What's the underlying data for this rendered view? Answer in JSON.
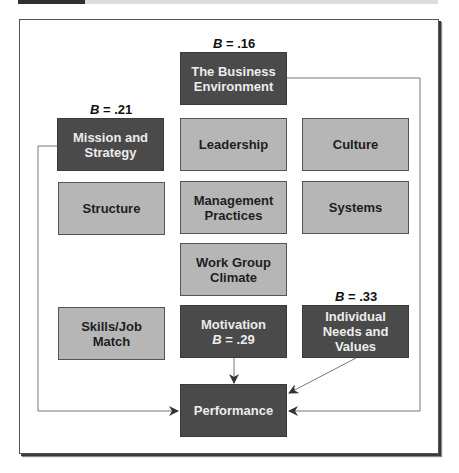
{
  "figure": {
    "title": "",
    "colors": {
      "driver_dark": "#4a4a4a",
      "factor_light": "#b6b6b6",
      "connector": "#666666"
    }
  },
  "boxes": {
    "business_environment": {
      "line1": "The Business",
      "line2": "Environment",
      "beta": ".16",
      "style": "dark"
    },
    "mission_strategy": {
      "line1": "Mission and",
      "line2": "Strategy",
      "beta": ".21",
      "style": "dark"
    },
    "leadership": {
      "line1": "Leadership",
      "style": "light"
    },
    "culture": {
      "line1": "Culture",
      "style": "light"
    },
    "structure": {
      "line1": "Structure",
      "style": "light"
    },
    "management_practices": {
      "line1": "Management",
      "line2": "Practices",
      "style": "light"
    },
    "systems": {
      "line1": "Systems",
      "style": "light"
    },
    "work_group_climate": {
      "line1": "Work Group",
      "line2": "Climate",
      "style": "light"
    },
    "skills_job_match": {
      "line1": "Skills/Job",
      "line2": "Match",
      "style": "light"
    },
    "motivation": {
      "line1": "Motivation",
      "beta": ".29",
      "style": "dark"
    },
    "individual_needs": {
      "line1": "Individual",
      "line2": "Needs and Values",
      "beta": ".33",
      "style": "dark"
    },
    "performance": {
      "line1": "Performance",
      "style": "dark"
    }
  },
  "beta_symbol": "B",
  "beta_eq": " = ",
  "connections": [
    {
      "from": "business_environment",
      "to": "performance"
    },
    {
      "from": "mission_strategy",
      "to": "performance"
    },
    {
      "from": "motivation",
      "to": "performance"
    },
    {
      "from": "individual_needs",
      "to": "performance"
    }
  ]
}
